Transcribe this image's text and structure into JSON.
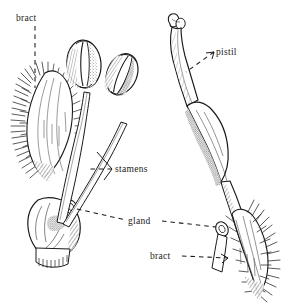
{
  "figure": {
    "width": 293,
    "height": 308,
    "background_color": "#ffffff",
    "ink_color": "#1a1a1a"
  },
  "labels": {
    "bract_left": "bract",
    "stamens": "stamens",
    "gland": "gland",
    "pistil": "pistil",
    "bract_right": "bract"
  },
  "specimens": [
    {
      "name": "staminate-flower",
      "side": "left",
      "parts": [
        "bract",
        "stamens",
        "gland",
        "ovary-base"
      ],
      "stamen_count": 2
    },
    {
      "name": "pistillate-flower",
      "side": "right",
      "parts": [
        "pistil",
        "stigma",
        "style",
        "ovary",
        "gland",
        "bract"
      ],
      "pistil_count": 1
    }
  ],
  "leader_lines": [
    {
      "name": "bract-left-leader",
      "style": "dashed",
      "orientation": "vertical"
    },
    {
      "name": "stamens-leader",
      "style": "dashed",
      "orientation": "bracket"
    },
    {
      "name": "gland-leader",
      "style": "dashed",
      "orientation": "horizontal"
    },
    {
      "name": "pistil-leader",
      "style": "dashed",
      "orientation": "diagonal"
    },
    {
      "name": "bract-right-leader",
      "style": "dashed",
      "orientation": "horizontal"
    }
  ]
}
